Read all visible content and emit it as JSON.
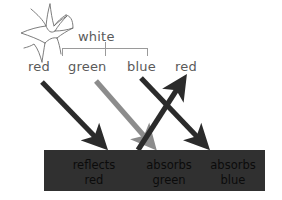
{
  "diagram": {
    "source": {
      "sparkle_icon": "sparkle-burst-icon",
      "white_label": "white",
      "components": [
        {
          "name": "red-component",
          "label": "red"
        },
        {
          "name": "green-component",
          "label": "green"
        },
        {
          "name": "blue-component",
          "label": "blue"
        }
      ],
      "reflected_label": "red"
    },
    "arrows": [
      {
        "name": "incident-red-arrow",
        "label": "red",
        "color": "#2b2b2b",
        "direction": "down-right"
      },
      {
        "name": "incident-green-arrow",
        "label": "green",
        "color": "#8c8c8c",
        "direction": "down-right"
      },
      {
        "name": "incident-blue-arrow",
        "label": "blue",
        "color": "#2b2b2b",
        "direction": "down-right"
      },
      {
        "name": "reflected-red-arrow",
        "label": "red",
        "color": "#2b2b2b",
        "direction": "up-right"
      }
    ],
    "surface": {
      "name": "absorbing-surface",
      "fill": "#303030",
      "text_color": "#0b0b0b",
      "cells": [
        {
          "line1": "reflects",
          "line2": "red"
        },
        {
          "line1": "absorbs",
          "line2": "green"
        },
        {
          "line1": "absorbs",
          "line2": "blue"
        }
      ]
    },
    "colors": {
      "label_gray": "#5a5a5a",
      "bracket_gray": "#9a9a9a",
      "dark_arrow": "#2b2b2b",
      "gray_arrow": "#8c8c8c",
      "surface_fill": "#303030",
      "background": "#ffffff"
    }
  }
}
